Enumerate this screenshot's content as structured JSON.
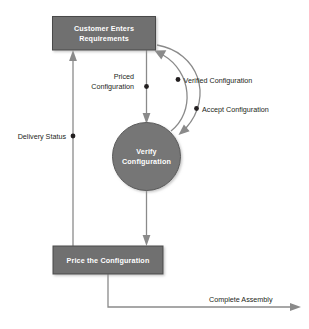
{
  "diagram": {
    "type": "data-flow-diagram",
    "background_color": "#ffffff",
    "node_fill_color": "#6f6f6f",
    "node_text_color": "#ffffff",
    "connector_color": "#8a8a8a",
    "label_text_color": "#231f20",
    "nodes": [
      {
        "id": "customer-enters-requirements",
        "shape": "rectangle",
        "label_line1": "Customer Enters",
        "label_line2": "Requirements"
      },
      {
        "id": "verify-configuration",
        "shape": "circle",
        "label_line1": "Verify",
        "label_line2": "Configuration"
      },
      {
        "id": "price-the-configuration",
        "shape": "rectangle",
        "label_line1": "Price the Configuration",
        "label_line2": ""
      }
    ],
    "flows": [
      {
        "id": "priced-configuration",
        "label_line1": "Priced",
        "label_line2": "Configuration",
        "from": "customer-enters-requirements",
        "to": "verify-configuration",
        "has_junction_dot": true
      },
      {
        "id": "verified-configuration",
        "label_line1": "Verified Configuration",
        "label_line2": "",
        "from": "verify-configuration",
        "to": "customer-enters-requirements",
        "has_junction_dot": true
      },
      {
        "id": "accept-configuration",
        "label_line1": "Accept Configuration",
        "label_line2": "",
        "from": "customer-enters-requirements",
        "to": "verify-configuration",
        "has_junction_dot": true
      },
      {
        "id": "delivery-status",
        "label_line1": "Delivery Status",
        "label_line2": "",
        "from": "price-the-configuration",
        "to": "customer-enters-requirements",
        "has_junction_dot": true
      },
      {
        "id": "complete-assembly",
        "label_line1": "Complete Assembly",
        "label_line2": "",
        "from": "price-the-configuration",
        "to": "external",
        "has_junction_dot": false
      }
    ]
  }
}
